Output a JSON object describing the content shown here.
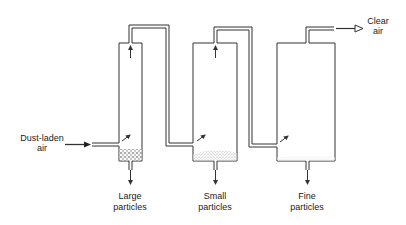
{
  "diagram": {
    "type": "process-flow",
    "inlet": {
      "label_line1": "Dust-laden",
      "label_line2": "air"
    },
    "outlet": {
      "label_line1": "Clear",
      "label_line2": "air"
    },
    "chambers": [
      {
        "id": "chamber-1",
        "output_line1": "Large",
        "output_line2": "particles"
      },
      {
        "id": "chamber-2",
        "output_line1": "Small",
        "output_line2": "particles"
      },
      {
        "id": "chamber-3",
        "output_line1": "Fine",
        "output_line2": "particles"
      }
    ],
    "colors": {
      "line": "#333333",
      "background": "#ffffff",
      "particles": "#555555"
    }
  }
}
